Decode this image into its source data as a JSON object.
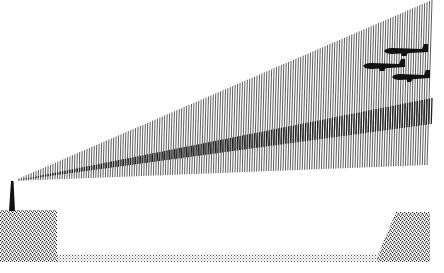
{
  "illustration": {
    "description": "Radar/searchlight beam fanning from a tower toward three aircraft silhouettes, with stippled ground blocks",
    "canvas": {
      "width": 444,
      "height": 273,
      "background": "#ffffff"
    },
    "colors": {
      "ink": "#111111",
      "beam_line": "#333333",
      "beam_dense": "#222222",
      "stipple": "#222222"
    },
    "tower": {
      "base_left": 9,
      "base_right": 15,
      "base_y": 211,
      "tip_x": 12,
      "tip_y": 181
    },
    "beam": {
      "origin_x": 13,
      "origin_y": 181,
      "end_x": 432,
      "top_end_y": 0,
      "bottom_end_y": 165,
      "line_count": 170,
      "dense_band": {
        "top_end_y": 98,
        "bottom_end_y": 124
      }
    },
    "aircraft": [
      {
        "name": "plane-1",
        "x": 384,
        "y": 51,
        "length": 44
      },
      {
        "name": "plane-2",
        "x": 363,
        "y": 66,
        "length": 42
      },
      {
        "name": "plane-3",
        "x": 392,
        "y": 77,
        "length": 38
      }
    ],
    "ground": {
      "left_block": {
        "points": "0,210 57,210 57,262 0,262"
      },
      "right_block": {
        "points": "396,212 430,212 430,262 375,262"
      },
      "strip": {
        "x": 57,
        "y": 254,
        "width": 320,
        "height": 8
      }
    }
  }
}
